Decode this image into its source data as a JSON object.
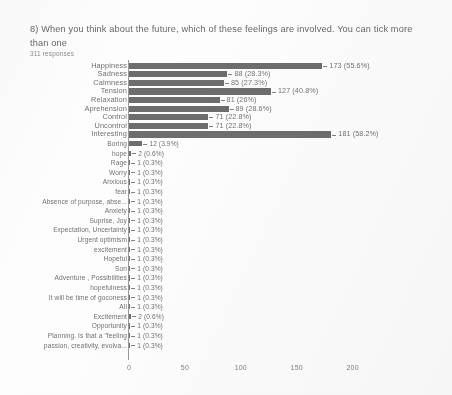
{
  "question": {
    "title": "8) When you think about the future, which of these feelings are involved. You can tick more than one",
    "responses": "311 responses"
  },
  "chart_data": {
    "type": "bar",
    "orientation": "horizontal",
    "title": "8) When you think about the future, which of these feelings are involved. You can tick more than one",
    "subtitle": "311 responses",
    "xlabel": "",
    "ylabel": "",
    "xlim": [
      0,
      215
    ],
    "xticks": [
      "0",
      "50",
      "100",
      "150",
      "200"
    ],
    "xtick_values": [
      0,
      50,
      100,
      150,
      200
    ],
    "grid": false,
    "legend": false,
    "total_responses": 311,
    "bar_color": "#575757",
    "categories": [
      "Happiness",
      "Sadness",
      "Calmness",
      "Tension",
      "Relaxation",
      "Aprehension",
      "Control",
      "Uncontrol",
      "Interesting",
      "Boring",
      "hope",
      "Rage",
      "Worry",
      "Anxious",
      "fear",
      "Absence of purpose, abse...",
      "Anxiety",
      "Suprise, Joy",
      "Expectation, Uncertainty",
      "Urgent optimism",
      "excitement",
      "Hopeful",
      "Son",
      "Adventure , Possibilities",
      "hopefulness",
      "It will be time of goconess",
      "All",
      "Excitement",
      "Opportunity",
      "Planning. Is that a \"feeling",
      "passion, creativity, evolva..."
    ],
    "values": [
      173,
      88,
      85,
      127,
      81,
      89,
      71,
      71,
      181,
      12,
      2,
      1,
      1,
      1,
      1,
      1,
      1,
      1,
      1,
      1,
      1,
      1,
      1,
      1,
      1,
      1,
      1,
      2,
      1,
      1,
      1
    ],
    "value_labels": [
      "173 (55.6%)",
      "88 (28.3%)",
      "85 (27.3%)",
      "127 (40.8%)",
      "81 (26%)",
      "89 (28.6%)",
      "71 (22.8%)",
      "71 (22.8%)",
      "181 (58.2%)",
      "12 (3.9%)",
      "2 (0.6%)",
      "1 (0.3%)",
      "1 (0.3%)",
      "1 (0.3%)",
      "1 (0.3%)",
      "1 (0.3%)",
      "1 (0.3%)",
      "1 (0.3%)",
      "1 (0.3%)",
      "1 (0.3%)",
      "1 (0.3%)",
      "1 (0.3%)",
      "1 (0.3%)",
      "1 (0.3%)",
      "1 (0.3%)",
      "1 (0.3%)",
      "1 (0.3%)",
      "2 (0.6%)",
      "1 (0.3%)",
      "1 (0.3%)",
      "1 (0.3%)"
    ]
  }
}
